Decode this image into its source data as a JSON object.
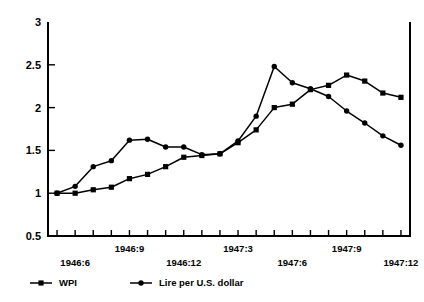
{
  "chart_data": {
    "type": "line",
    "title": "",
    "subtitle": "",
    "xlabel": "",
    "ylabel": "",
    "ylim": [
      0.5,
      3
    ],
    "yticks": [
      0.5,
      1,
      1.5,
      2,
      2.5,
      3
    ],
    "ytick_labels": [
      "0.5",
      "1",
      "1.5",
      "2",
      "2.5",
      "3"
    ],
    "grid": false,
    "legend_position": "bottom-left",
    "x": [
      "1946:5",
      "1946:6",
      "1946:7",
      "1946:8",
      "1946:9",
      "1946:10",
      "1946:11",
      "1946:12",
      "1947:1",
      "1947:2",
      "1947:3",
      "1947:4",
      "1947:5",
      "1947:6",
      "1947:7",
      "1947:8",
      "1947:9",
      "1947:10",
      "1947:11",
      "1947:12"
    ],
    "xtick_labels": [
      {
        "label": "1946:6",
        "index": 1,
        "row": 1
      },
      {
        "label": "1946:9",
        "index": 4,
        "row": 0
      },
      {
        "label": "1946:12",
        "index": 7,
        "row": 1
      },
      {
        "label": "1947:3",
        "index": 10,
        "row": 0
      },
      {
        "label": "1947:6",
        "index": 13,
        "row": 1
      },
      {
        "label": "1947:9",
        "index": 16,
        "row": 0
      },
      {
        "label": "1947:12",
        "index": 19,
        "row": 1
      }
    ],
    "series": [
      {
        "name": "WPI",
        "marker": "square",
        "values": [
          1.0,
          1.0,
          1.04,
          1.07,
          1.17,
          1.22,
          1.31,
          1.42,
          1.44,
          1.46,
          1.59,
          1.74,
          2.0,
          2.04,
          2.21,
          2.26,
          2.38,
          2.31,
          2.17,
          2.12
        ]
      },
      {
        "name": "Lire per U.S. dollar",
        "marker": "circle",
        "values": [
          1.0,
          1.08,
          1.31,
          1.38,
          1.62,
          1.63,
          1.54,
          1.54,
          1.45,
          1.46,
          1.61,
          1.9,
          2.48,
          2.29,
          2.22,
          2.13,
          1.96,
          1.82,
          1.67,
          1.56
        ]
      }
    ]
  },
  "legend": {
    "entries": [
      {
        "label": "WPI",
        "marker": "square"
      },
      {
        "label": "Lire per U.S. dollar",
        "marker": "circle"
      }
    ]
  }
}
